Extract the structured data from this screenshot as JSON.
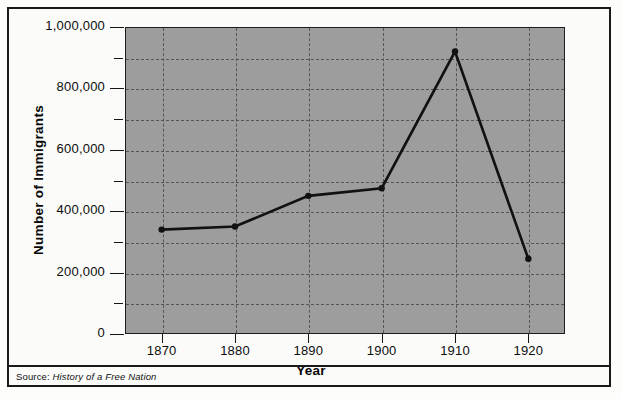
{
  "figure": {
    "background_color": "#fbfbf9",
    "plot_background_color": "#9d9d9d",
    "line_color": "#111111",
    "grid_color": "#565656"
  },
  "source": {
    "label": "Source:",
    "title": "History of a Free Nation"
  },
  "chart_data": {
    "type": "line",
    "title": "",
    "xlabel": "Year",
    "ylabel": "Number of Immigrants",
    "categories": [
      "1870",
      "1880",
      "1890",
      "1900",
      "1910",
      "1920"
    ],
    "x": [
      1870,
      1880,
      1890,
      1900,
      1910,
      1920
    ],
    "values": [
      340000,
      350000,
      450000,
      475000,
      920000,
      245000
    ],
    "series": [
      {
        "name": "Number of Immigrants",
        "values": [
          340000,
          350000,
          450000,
          475000,
          920000,
          245000
        ]
      }
    ],
    "xlim": [
      1865,
      1925
    ],
    "ylim": [
      0,
      1000000
    ],
    "y_major_ticks": [
      0,
      200000,
      400000,
      600000,
      800000,
      1000000
    ],
    "y_minor_ticks": [
      100000,
      300000,
      500000,
      700000,
      900000
    ],
    "y_tick_labels": [
      "0",
      "200,000",
      "400,000",
      "600,000",
      "800,000",
      "1,000,000"
    ],
    "x_tick_labels": [
      "1870",
      "1880",
      "1890",
      "1900",
      "1910",
      "1920"
    ],
    "grid": true,
    "grid_style": "dashed",
    "legend": false,
    "marker": "circle"
  }
}
